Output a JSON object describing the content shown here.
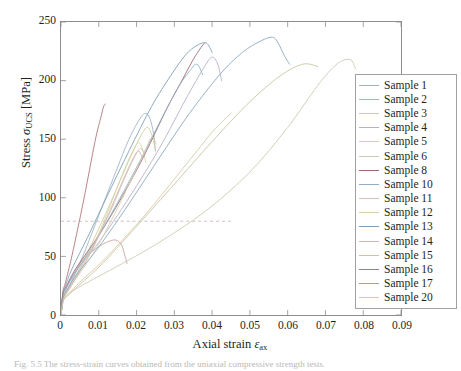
{
  "chart_data": {
    "type": "line",
    "title": "",
    "xlabel": "Axial strain εax",
    "ylabel": "Stress σUCS [MPa]",
    "xlim": [
      0,
      0.09
    ],
    "ylim": [
      0,
      250
    ],
    "xticks": [
      "0",
      "0.01",
      "0.02",
      "0.03",
      "0.04",
      "0.05",
      "0.06",
      "0.07",
      "0.08",
      "0.09"
    ],
    "yticks": [
      "0",
      "50",
      "100",
      "150",
      "200",
      "250"
    ],
    "grid": false,
    "legend_position": "right",
    "annotations": [
      {
        "type": "hline",
        "y": 80,
        "style": "dashed",
        "color": "#cfb6b6",
        "x_from": 0,
        "x_to": 0.045
      }
    ],
    "series": [
      {
        "name": "Sample 1",
        "color": "#9fb4c6",
        "x": [
          0,
          0.0006,
          0.0015,
          0.003,
          0.006,
          0.01,
          0.014,
          0.018,
          0.021,
          0.0225,
          0.0235,
          0.0245,
          0.025
        ],
        "y": [
          0,
          14,
          20,
          30,
          52,
          85,
          118,
          150,
          168,
          172,
          168,
          155,
          140
        ]
      },
      {
        "name": "Sample 2",
        "color": "#c8a5a0",
        "x": [
          0,
          0.0005,
          0.0013,
          0.003,
          0.006,
          0.009,
          0.012,
          0.0145,
          0.016,
          0.0168,
          0.0175
        ],
        "y": [
          0,
          16,
          22,
          33,
          48,
          56,
          62,
          64,
          60,
          52,
          44
        ]
      },
      {
        "name": "Sample 3",
        "color": "#cfcf9c",
        "x": [
          0,
          0.0006,
          0.0015,
          0.004,
          0.008,
          0.013,
          0.018,
          0.0215,
          0.023,
          0.0242,
          0.025
        ],
        "y": [
          0,
          15,
          21,
          34,
          60,
          95,
          132,
          155,
          160,
          152,
          140
        ]
      },
      {
        "name": "Sample 4",
        "color": "#b9aec9",
        "x": [
          0,
          0.0005,
          0.0014,
          0.004,
          0.01,
          0.018,
          0.026,
          0.033,
          0.038,
          0.04,
          0.0415,
          0.0425
        ],
        "y": [
          0,
          17,
          24,
          38,
          62,
          100,
          142,
          184,
          212,
          220,
          214,
          200
        ]
      },
      {
        "name": "Sample 5",
        "color": "#d8d2a8",
        "x": [
          0,
          0.0006,
          0.0016,
          0.004,
          0.008,
          0.012,
          0.016,
          0.019,
          0.0205,
          0.0215,
          0.0225
        ],
        "y": [
          0,
          14,
          20,
          32,
          55,
          85,
          118,
          140,
          147,
          142,
          130
        ]
      },
      {
        "name": "Sample 6",
        "color": "#c9cdb3",
        "x": [
          0,
          0.0006,
          0.002,
          0.006,
          0.014,
          0.025,
          0.038,
          0.05,
          0.06,
          0.068,
          0.073,
          0.0765,
          0.078
        ],
        "y": [
          0,
          12,
          18,
          26,
          40,
          60,
          88,
          122,
          160,
          196,
          214,
          218,
          210
        ]
      },
      {
        "name": "Sample 8",
        "color": "#9d6b72",
        "x": [
          0,
          0.0005,
          0.0015,
          0.004,
          0.01,
          0.016,
          0.022,
          0.028,
          0.032,
          0.035,
          0.037,
          0.038
        ],
        "y": [
          0,
          18,
          25,
          40,
          68,
          100,
          136,
          176,
          200,
          218,
          228,
          232
        ]
      },
      {
        "name": "Sample 10",
        "color": "#8fb0c4",
        "x": [
          0,
          0.0005,
          0.0014,
          0.004,
          0.009,
          0.015,
          0.021,
          0.027,
          0.031,
          0.034,
          0.036,
          0.0375
        ],
        "y": [
          0,
          16,
          23,
          37,
          62,
          96,
          132,
          170,
          194,
          208,
          214,
          205
        ]
      },
      {
        "name": "Sample 11",
        "color": "#d7bfbb",
        "x": [
          0,
          0.0006,
          0.0018,
          0.004,
          0.008,
          0.013,
          0.017,
          0.0195,
          0.021,
          0.022
        ],
        "y": [
          0,
          15,
          22,
          34,
          56,
          88,
          118,
          135,
          142,
          138
        ]
      },
      {
        "name": "Sample 12",
        "color": "#d5cfb0",
        "x": [
          0,
          0.0006,
          0.0016,
          0.004,
          0.009,
          0.014,
          0.019,
          0.0225,
          0.024,
          0.0252
        ],
        "y": [
          0,
          13,
          19,
          31,
          55,
          85,
          118,
          142,
          152,
          146
        ]
      },
      {
        "name": "Sample 13",
        "color": "#7f9fb8",
        "x": [
          0,
          0.0005,
          0.0013,
          0.003,
          0.007,
          0.012,
          0.018,
          0.024,
          0.029,
          0.033,
          0.036,
          0.0385,
          0.04
        ],
        "y": [
          0,
          18,
          26,
          40,
          66,
          100,
          140,
          178,
          204,
          222,
          230,
          232,
          224
        ]
      },
      {
        "name": "Sample 14",
        "color": "#cdb9b0",
        "x": [
          0,
          0.0006,
          0.0017,
          0.004,
          0.008,
          0.012,
          0.016,
          0.019,
          0.0205,
          0.0215
        ],
        "y": [
          0,
          14,
          20,
          32,
          54,
          82,
          112,
          133,
          140,
          134
        ]
      },
      {
        "name": "Sample 15",
        "color": "#c6c6a4",
        "x": [
          0,
          0.0006,
          0.002,
          0.005,
          0.011,
          0.019,
          0.029,
          0.04,
          0.05,
          0.058,
          0.064,
          0.068
        ],
        "y": [
          0,
          12,
          17,
          26,
          44,
          72,
          108,
          148,
          182,
          204,
          214,
          212
        ]
      },
      {
        "name": "Sample 16",
        "color": "#b0777c",
        "x": [
          0,
          0.0005,
          0.0012,
          0.003,
          0.006,
          0.009,
          0.0105,
          0.0113,
          0.0118
        ],
        "y": [
          0,
          20,
          28,
          52,
          98,
          148,
          168,
          178,
          180
        ]
      },
      {
        "name": "Sample 17",
        "color": "#8aa9c0",
        "x": [
          0,
          0.0006,
          0.0015,
          0.004,
          0.01,
          0.018,
          0.026,
          0.034,
          0.042,
          0.048,
          0.053,
          0.056,
          0.0575,
          0.059,
          0.0605
        ],
        "y": [
          0,
          15,
          21,
          34,
          58,
          95,
          134,
          172,
          205,
          224,
          234,
          237,
          232,
          222,
          214
        ]
      },
      {
        "name": "Sample 20",
        "color": "#d9c9a6",
        "x": [
          0,
          0.0007,
          0.002,
          0.005,
          0.011,
          0.018,
          0.024,
          0.03,
          0.036,
          0.04,
          0.043,
          0.045
        ],
        "y": [
          0,
          13,
          18,
          28,
          46,
          70,
          92,
          116,
          140,
          156,
          166,
          172
        ]
      }
    ]
  },
  "caption": "Fig. 5.5  The stress-strain curves obtained from the uniaxial compressive strength tests.",
  "legend": {
    "entries": [
      "Sample 1",
      "Sample 2",
      "Sample 3",
      "Sample 4",
      "Sample 5",
      "Sample 6",
      "Sample 8",
      "Sample 10",
      "Sample 11",
      "Sample 12",
      "Sample 13",
      "Sample 14",
      "Sample 15",
      "Sample 16",
      "Sample 17",
      "Sample 20"
    ]
  }
}
